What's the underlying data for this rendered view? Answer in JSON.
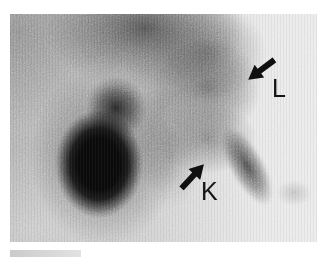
{
  "figure": {
    "annotations": [
      {
        "text": "L",
        "arrow": "pointing-down-left"
      },
      {
        "text": "K",
        "arrow": "pointing-up-right"
      }
    ],
    "colors": {
      "page_background": "#ffffff",
      "film_light": "#e9e9e9",
      "film_mid_gray": "#c0c0c0",
      "dense_mass": "#0a0a0a",
      "annotation_ink": "#141414"
    }
  }
}
